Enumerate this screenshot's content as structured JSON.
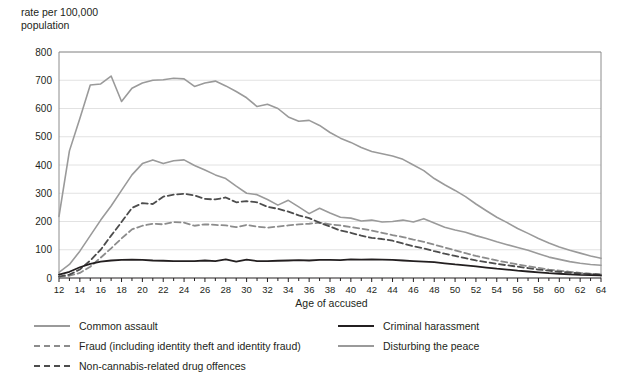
{
  "chart_data": {
    "type": "line",
    "title": "",
    "xlabel": "Age of accused",
    "ylabel": "rate per 100,000\npopulation",
    "xlim": [
      12,
      64
    ],
    "ylim": [
      0,
      800
    ],
    "ytick_step": 100,
    "xtick_step": 2,
    "grid": "horizontal",
    "legend_position": "bottom",
    "yticks": [
      0,
      100,
      200,
      300,
      400,
      500,
      600,
      700,
      800
    ],
    "xticks": [
      12,
      14,
      16,
      18,
      20,
      22,
      24,
      26,
      28,
      30,
      32,
      34,
      36,
      38,
      40,
      42,
      44,
      46,
      48,
      50,
      52,
      54,
      56,
      58,
      60,
      62,
      64
    ],
    "x": [
      12,
      13,
      14,
      15,
      16,
      17,
      18,
      19,
      20,
      21,
      22,
      23,
      24,
      25,
      26,
      27,
      28,
      29,
      30,
      31,
      32,
      33,
      34,
      35,
      36,
      37,
      38,
      39,
      40,
      41,
      42,
      43,
      44,
      45,
      46,
      47,
      48,
      49,
      50,
      51,
      52,
      53,
      54,
      55,
      56,
      57,
      58,
      59,
      60,
      61,
      62,
      63,
      64
    ],
    "series": [
      {
        "name": "Common assault",
        "color": "#9a9a9a",
        "style": "solid",
        "width": 1.6,
        "values": [
          218,
          450,
          565,
          683,
          687,
          715,
          625,
          672,
          690,
          700,
          702,
          707,
          705,
          678,
          690,
          697,
          680,
          660,
          638,
          607,
          615,
          600,
          570,
          555,
          558,
          540,
          515,
          495,
          480,
          462,
          448,
          440,
          432,
          420,
          400,
          380,
          352,
          330,
          310,
          288,
          262,
          238,
          215,
          196,
          175,
          158,
          140,
          124,
          110,
          98,
          88,
          78,
          70
        ]
      },
      {
        "name": "Disturbing the peace",
        "color": "#9a9a9a",
        "style": "solid",
        "width": 1.6,
        "values": [
          20,
          48,
          95,
          150,
          205,
          255,
          310,
          365,
          405,
          418,
          405,
          415,
          418,
          398,
          382,
          365,
          352,
          325,
          300,
          295,
          278,
          258,
          275,
          252,
          228,
          247,
          230,
          215,
          212,
          202,
          205,
          198,
          200,
          205,
          198,
          210,
          195,
          180,
          170,
          162,
          150,
          140,
          128,
          118,
          108,
          98,
          86,
          74,
          66,
          58,
          52,
          48,
          45
        ]
      },
      {
        "name": "Non-cannabis-related drug offences",
        "color": "#4d4d4d",
        "style": "dashed",
        "width": 1.8,
        "values": [
          5,
          12,
          30,
          62,
          100,
          150,
          198,
          248,
          265,
          262,
          288,
          295,
          298,
          292,
          280,
          278,
          285,
          268,
          272,
          268,
          252,
          245,
          235,
          222,
          212,
          196,
          182,
          168,
          160,
          150,
          142,
          138,
          132,
          122,
          112,
          105,
          95,
          86,
          78,
          70,
          62,
          56,
          50,
          45,
          40,
          35,
          30,
          26,
          22,
          19,
          16,
          14,
          12
        ]
      },
      {
        "name": "Fraud (including identity theft and identity fraud)",
        "color": "#8c8c8c",
        "style": "dashed",
        "width": 1.8,
        "values": [
          3,
          8,
          18,
          40,
          72,
          105,
          140,
          172,
          185,
          192,
          190,
          198,
          196,
          185,
          190,
          188,
          186,
          180,
          188,
          182,
          178,
          182,
          186,
          190,
          192,
          196,
          190,
          186,
          180,
          175,
          168,
          160,
          152,
          145,
          136,
          128,
          118,
          108,
          98,
          88,
          78,
          70,
          62,
          55,
          48,
          42,
          36,
          30,
          26,
          22,
          18,
          15,
          13
        ]
      },
      {
        "name": "Criminal harassment",
        "color": "#231f20",
        "style": "solid",
        "width": 1.8,
        "values": [
          12,
          22,
          38,
          50,
          58,
          62,
          64,
          65,
          64,
          62,
          61,
          60,
          60,
          60,
          62,
          60,
          66,
          58,
          65,
          60,
          60,
          61,
          62,
          63,
          62,
          64,
          64,
          63,
          66,
          65,
          66,
          65,
          64,
          62,
          60,
          58,
          56,
          52,
          48,
          45,
          41,
          37,
          33,
          30,
          26,
          23,
          20,
          17,
          15,
          13,
          11,
          10,
          9
        ]
      }
    ]
  },
  "legend": {
    "left_items": [
      {
        "label": "Common assault",
        "color": "#9a9a9a",
        "style": "solid"
      },
      {
        "label": "Fraud (including identity theft and identity fraud)",
        "color": "#8c8c8c",
        "style": "dashed"
      },
      {
        "label": "Non-cannabis-related drug offences",
        "color": "#4d4d4d",
        "style": "dashed"
      }
    ],
    "right_items": [
      {
        "label": "Criminal harassment",
        "color": "#231f20",
        "style": "solid"
      },
      {
        "label": "Disturbing the peace",
        "color": "#9a9a9a",
        "style": "solid"
      }
    ]
  },
  "axes": {
    "y_title": "rate per 100,000\npopulation",
    "x_title": "Age of accused"
  }
}
